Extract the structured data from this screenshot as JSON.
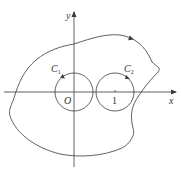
{
  "figure": {
    "type": "contour-integral-diagram",
    "axes": {
      "x_label": "x",
      "y_label": "y",
      "origin_label": "O",
      "tick_label": "1"
    },
    "curves": [
      {
        "name": "C1",
        "label": "C",
        "subscript": "1",
        "center": [
          0,
          0
        ],
        "shape": "circle",
        "orientation": "counterclockwise"
      },
      {
        "name": "C2",
        "label": "C",
        "subscript": "2",
        "center": [
          1,
          0
        ],
        "shape": "circle",
        "orientation": "counterclockwise"
      },
      {
        "name": "outer",
        "shape": "closed-curve",
        "orientation": "counterclockwise"
      }
    ],
    "colors": {
      "stroke": "#3a3a3a",
      "background": "#ffffff"
    }
  }
}
